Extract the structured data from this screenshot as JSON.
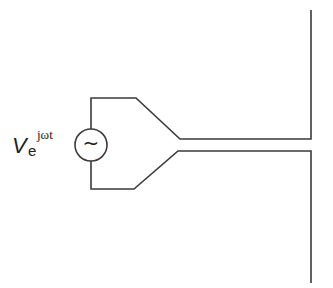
{
  "diagram": {
    "source": {
      "symbol": "~",
      "label_main": "V",
      "label_subscript": "e",
      "label_superscript": "jωt"
    },
    "colors": {
      "line": "#3a3a3a",
      "background": "#ffffff",
      "text": "#222222"
    }
  }
}
